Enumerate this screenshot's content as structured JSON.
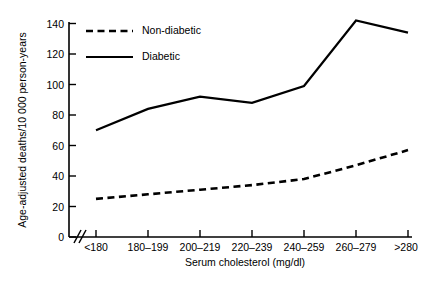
{
  "chart_data": {
    "type": "line",
    "title": "",
    "xlabel": "Serum cholesterol (mg/dl)",
    "ylabel": "Age-adjusted deaths/10 000 person-years",
    "categories": [
      "<180",
      "180–199",
      "200–219",
      "220–239",
      "240–259",
      "260–279",
      ">280"
    ],
    "ylim": [
      0,
      140
    ],
    "yticks": [
      0,
      20,
      40,
      60,
      80,
      100,
      120,
      140
    ],
    "ytick_labels": [
      "0",
      "20",
      "40",
      "60",
      "80",
      "100",
      "120",
      "140"
    ],
    "grid": false,
    "axis_break": true,
    "legend_position": "top-left-inside",
    "series": [
      {
        "name": "Non-diabetic",
        "style": "dashed",
        "color": "#000000",
        "values": [
          25,
          28,
          31,
          34,
          38,
          47,
          57
        ]
      },
      {
        "name": "Diabetic",
        "style": "solid",
        "color": "#000000",
        "values": [
          70,
          84,
          92,
          88,
          99,
          142,
          134
        ]
      }
    ]
  },
  "legend": {
    "items": [
      {
        "label": "Non-diabetic",
        "style": "dashed"
      },
      {
        "label": "Diabetic",
        "style": "solid"
      }
    ]
  },
  "colors": {
    "ink": "#000000",
    "background": "#ffffff"
  }
}
